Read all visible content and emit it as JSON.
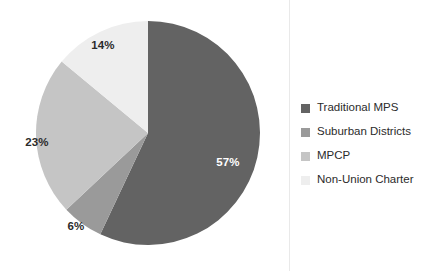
{
  "chart_data": {
    "type": "pie",
    "title": "",
    "xlabel": "",
    "ylabel": "",
    "grid": false,
    "legend_position": "right",
    "start_angle_deg": 0,
    "direction": "clockwise",
    "categories": [
      "Traditional MPS",
      "Suburban Districts",
      "MPCP",
      "Non-Union Charter"
    ],
    "values": [
      57,
      6,
      23,
      14
    ],
    "unit": "%",
    "data_labels": [
      "57%",
      "6%",
      "23%",
      "14%"
    ],
    "colors": [
      "#636363",
      "#9a9a9a",
      "#c5c5c5",
      "#eeeeee"
    ],
    "slices": [
      {
        "label": "Traditional MPS",
        "value": 57,
        "data_label": "57%",
        "color": "#636363",
        "label_color": "dark-bg",
        "label_x": 228,
        "label_y": 162
      },
      {
        "label": "Suburban Districts",
        "value": 6,
        "data_label": "6%",
        "color": "#9a9a9a",
        "label_color": "light-bg",
        "label_x": 76,
        "label_y": 226
      },
      {
        "label": "MPCP",
        "value": 23,
        "data_label": "23%",
        "color": "#c5c5c5",
        "label_color": "light-bg",
        "label_x": 37,
        "label_y": 142
      },
      {
        "label": "Non-Union Charter",
        "value": 14,
        "data_label": "14%",
        "color": "#eeeeee",
        "label_color": "light-bg",
        "label_x": 103,
        "label_y": 45
      }
    ]
  },
  "legend": {
    "items": [
      {
        "label": "Traditional MPS",
        "color": "#636363"
      },
      {
        "label": "Suburban Districts",
        "color": "#9a9a9a"
      },
      {
        "label": "MPCP",
        "color": "#c5c5c5"
      },
      {
        "label": "Non-Union Charter",
        "color": "#eeeeee"
      }
    ]
  }
}
